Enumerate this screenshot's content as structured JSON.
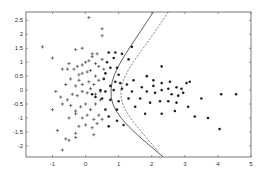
{
  "chart_data": {
    "type": "scatter",
    "title": "",
    "xlabel": "",
    "ylabel": "",
    "xlim": [
      -1.8,
      5
    ],
    "ylim": [
      -2.4,
      2.8
    ],
    "xticks": [
      -1,
      0,
      1,
      2,
      3,
      4,
      5
    ],
    "yticks": [
      -2,
      -1.5,
      -1,
      -0.5,
      0,
      0.5,
      1,
      1.5,
      2,
      2.5
    ],
    "xtick_labels": [
      "-1",
      "0",
      "1",
      "2",
      "3",
      "4",
      "5"
    ],
    "ytick_labels": [
      "-2",
      "-1.5",
      "-1",
      "-0.5",
      "0",
      "0.5",
      "1",
      "1.5",
      "2",
      "2.5"
    ],
    "grid": false,
    "legend": null,
    "series": [
      {
        "name": "class-plus",
        "marker": "+",
        "color": "#444444",
        "points": [
          [
            0.1,
            2.6
          ],
          [
            0.5,
            2.2
          ],
          [
            0.5,
            1.95
          ],
          [
            -1.3,
            1.55
          ],
          [
            -0.3,
            1.45
          ],
          [
            -1,
            1.15
          ],
          [
            -0.1,
            1.5
          ],
          [
            0.2,
            1.3
          ],
          [
            0.35,
            1.3
          ],
          [
            -0.5,
            0.95
          ],
          [
            -0.7,
            0.75
          ],
          [
            -0.55,
            0.75
          ],
          [
            -0.35,
            0.75
          ],
          [
            -0.25,
            0.85
          ],
          [
            -0.1,
            0.9
          ],
          [
            0,
            1
          ],
          [
            0.1,
            1.05
          ],
          [
            0.2,
            1.2
          ],
          [
            0.3,
            0.95
          ],
          [
            0.4,
            0.85
          ],
          [
            0.5,
            1.1
          ],
          [
            0.55,
            0.75
          ],
          [
            -0.2,
            0.55
          ],
          [
            -0.1,
            0.6
          ],
          [
            0.05,
            0.65
          ],
          [
            0.15,
            0.7
          ],
          [
            0.3,
            0.5
          ],
          [
            -0.45,
            0.4
          ],
          [
            -0.2,
            0.35
          ],
          [
            -0.6,
            0.2
          ],
          [
            -0.3,
            0.15
          ],
          [
            -0.1,
            0.2
          ],
          [
            0.1,
            0.3
          ],
          [
            0.25,
            0.2
          ],
          [
            0.4,
            0.35
          ],
          [
            -0.9,
            -0.05
          ],
          [
            -0.75,
            -0.25
          ],
          [
            -0.55,
            -0.35
          ],
          [
            -0.4,
            -0.15
          ],
          [
            -0.25,
            -0.2
          ],
          [
            -0.1,
            -0.05
          ],
          [
            0.05,
            -0.1
          ],
          [
            0.15,
            0.05
          ],
          [
            0.3,
            -0.15
          ],
          [
            0.45,
            -0.05
          ],
          [
            -1,
            -0.7
          ],
          [
            -0.7,
            -0.5
          ],
          [
            -0.45,
            -0.55
          ],
          [
            -0.3,
            -0.75
          ],
          [
            -0.15,
            -0.6
          ],
          [
            0,
            -0.5
          ],
          [
            0.15,
            -0.7
          ],
          [
            0.3,
            -0.5
          ],
          [
            0.45,
            -0.35
          ],
          [
            -0.5,
            -1
          ],
          [
            -0.3,
            -0.85
          ],
          [
            -0.1,
            -1
          ],
          [
            0.05,
            -0.9
          ],
          [
            0.25,
            -1.05
          ],
          [
            0.4,
            -0.9
          ],
          [
            -0.2,
            -1.3
          ],
          [
            0,
            -1.25
          ],
          [
            0.2,
            -1.35
          ],
          [
            0.35,
            -1.2
          ],
          [
            0.5,
            -1.05
          ],
          [
            -0.3,
            -1.55
          ],
          [
            0.25,
            -1.6
          ],
          [
            -0.85,
            -1.45
          ],
          [
            -0.6,
            -1.75
          ],
          [
            -0.5,
            -1.8
          ],
          [
            -0.3,
            -1.7
          ],
          [
            -0.7,
            -2.15
          ]
        ]
      },
      {
        "name": "class-dot",
        "marker": "o",
        "color": "#222222",
        "points": [
          [
            0.7,
            1.35
          ],
          [
            0.9,
            1.35
          ],
          [
            1.1,
            1.3
          ],
          [
            1.4,
            1.55
          ],
          [
            1.3,
            1.1
          ],
          [
            0.65,
            1.0
          ],
          [
            0.85,
            1.15
          ],
          [
            0.75,
            0.8
          ],
          [
            0.95,
            0.8
          ],
          [
            0.6,
            0.6
          ],
          [
            1.0,
            0.55
          ],
          [
            0.9,
            0.3
          ],
          [
            0.55,
            0.4
          ],
          [
            0.75,
            0.15
          ],
          [
            1.05,
            0.25
          ],
          [
            1.25,
            0.2
          ],
          [
            1.45,
            0.35
          ],
          [
            0.45,
            0.0
          ],
          [
            0.6,
            -0.05
          ],
          [
            0.85,
            0.0
          ],
          [
            1.1,
            0.05
          ],
          [
            1.4,
            -0.05
          ],
          [
            1.7,
            0.1
          ],
          [
            1.85,
            0.5
          ],
          [
            2.3,
            0.85
          ],
          [
            2.05,
            0.35
          ],
          [
            2.3,
            0.25
          ],
          [
            2.55,
            0.3
          ],
          [
            2.05,
            0.15
          ],
          [
            2.3,
            0.0
          ],
          [
            2.5,
            0.05
          ],
          [
            2.75,
            0.1
          ],
          [
            2.9,
            0.05
          ],
          [
            3.05,
            0.25
          ],
          [
            3.15,
            0.3
          ],
          [
            1.85,
            -0.05
          ],
          [
            2.1,
            -0.1
          ],
          [
            2.6,
            -0.15
          ],
          [
            2.8,
            -0.2
          ],
          [
            2.95,
            -0.1
          ],
          [
            0.5,
            -0.3
          ],
          [
            0.75,
            -0.35
          ],
          [
            1.0,
            -0.4
          ],
          [
            1.3,
            -0.3
          ],
          [
            1.65,
            -0.3
          ],
          [
            1.95,
            -0.45
          ],
          [
            2.25,
            -0.4
          ],
          [
            2.5,
            -0.4
          ],
          [
            2.75,
            -0.45
          ],
          [
            3.1,
            -0.6
          ],
          [
            3.5,
            -0.3
          ],
          [
            4.1,
            -0.15
          ],
          [
            4.55,
            -0.15
          ],
          [
            0.6,
            -0.7
          ],
          [
            0.95,
            -0.7
          ],
          [
            1.5,
            -0.6
          ],
          [
            1.8,
            -0.85
          ],
          [
            2.3,
            -0.85
          ],
          [
            2.7,
            -0.75
          ],
          [
            3.3,
            -0.95
          ],
          [
            3.7,
            -1.0
          ],
          [
            4.05,
            -1.4
          ],
          [
            0.7,
            -0.95
          ],
          [
            0.95,
            -1.1
          ],
          [
            0.7,
            -1.3
          ],
          [
            1.15,
            -1.25
          ],
          [
            0.2,
            -0.15
          ],
          [
            0.3,
            -0.25
          ]
        ]
      },
      {
        "name": "decision-boundary-solid",
        "marker": "line",
        "style": "solid",
        "color": "#333333",
        "points": [
          [
            2.05,
            2.8
          ],
          [
            1.6,
            2.0
          ],
          [
            1.15,
            1.2
          ],
          [
            0.85,
            0.55
          ],
          [
            0.75,
            0.0
          ],
          [
            0.8,
            -0.5
          ],
          [
            1.05,
            -1.0
          ],
          [
            1.55,
            -1.6
          ],
          [
            2.35,
            -2.4
          ]
        ]
      },
      {
        "name": "decision-boundary-dashed",
        "marker": "line",
        "style": "dashed",
        "color": "#555555",
        "points": [
          [
            2.5,
            2.8
          ],
          [
            2.05,
            2.0
          ],
          [
            1.55,
            1.2
          ],
          [
            1.2,
            0.55
          ],
          [
            1.05,
            0.0
          ],
          [
            1.1,
            -0.5
          ],
          [
            1.35,
            -1.0
          ],
          [
            1.75,
            -1.6
          ],
          [
            2.2,
            -2.2
          ]
        ]
      }
    ]
  }
}
